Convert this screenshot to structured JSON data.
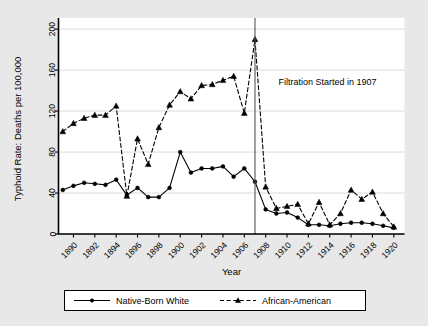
{
  "chart_data": {
    "type": "line",
    "title": "",
    "xlabel": "Year",
    "ylabel": "Typhoid Rate: Deaths per 100,000",
    "xlim": [
      1888.6,
      1921.0
    ],
    "ylim": [
      0,
      205
    ],
    "xticks": [
      1890,
      1892,
      1894,
      1896,
      1898,
      1900,
      1902,
      1904,
      1906,
      1908,
      1910,
      1912,
      1914,
      1916,
      1918,
      1920
    ],
    "xtick_labels": [
      "1890",
      "1892",
      "1894",
      "1896",
      "1898",
      "1900",
      "1902",
      "1904",
      "1906",
      "1908",
      "1910",
      "1912",
      "1914",
      "1916",
      "1918",
      "1920"
    ],
    "yticks": [
      0,
      40,
      80,
      120,
      160,
      200
    ],
    "ytick_labels": [
      "0",
      "40",
      "80",
      "120",
      "160",
      "200"
    ],
    "grid": true,
    "grid_axis": "y",
    "legend_position": "bottom",
    "x": [
      1889,
      1890,
      1891,
      1892,
      1893,
      1894,
      1895,
      1896,
      1897,
      1898,
      1899,
      1900,
      1901,
      1902,
      1903,
      1904,
      1905,
      1906,
      1907,
      1908,
      1909,
      1910,
      1911,
      1912,
      1913,
      1914,
      1915,
      1916,
      1917,
      1918,
      1919,
      1920
    ],
    "series": [
      {
        "name": "Native-Born White",
        "marker": "circle",
        "linestyle": "solid",
        "color": "#000000",
        "values": [
          43,
          47,
          50,
          49,
          48,
          53,
          38,
          45,
          36,
          36,
          45,
          80,
          60,
          64,
          64,
          66,
          56,
          64,
          51,
          24,
          20,
          21,
          16,
          9,
          9,
          8,
          10,
          11,
          11,
          10,
          8,
          6
        ]
      },
      {
        "name": "African-American",
        "marker": "triangle",
        "linestyle": "dashed",
        "color": "#000000",
        "values": [
          100,
          108,
          113,
          116,
          116,
          125,
          37,
          93,
          68,
          104,
          126,
          139,
          132,
          145,
          146,
          150,
          154,
          118,
          190,
          46,
          25,
          27,
          29,
          10,
          31,
          9,
          20,
          43,
          34,
          41,
          20,
          7
        ]
      }
    ],
    "annotations": [
      {
        "name": "filtration-annotation",
        "text": "Filtration Started in 1907",
        "x": 1909.2,
        "y": 148
      }
    ],
    "vlines": [
      {
        "name": "filtration-year-line",
        "x": 1907,
        "color": "#555555"
      }
    ]
  },
  "legend": {
    "items": [
      {
        "label": "Native-Born White",
        "marker": "circle",
        "linestyle": "solid"
      },
      {
        "label": "African-American",
        "marker": "triangle",
        "linestyle": "dashed"
      }
    ]
  }
}
